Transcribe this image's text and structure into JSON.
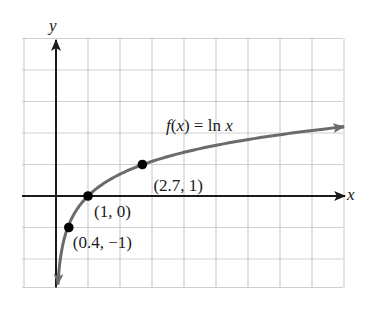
{
  "chart_data": {
    "type": "line",
    "title": "",
    "function_label": "f(x) = ln x",
    "function_label_parts": {
      "f": "f",
      "open": "(",
      "x": "x",
      "rest": ") = ln ",
      "x2": "x"
    },
    "xlabel": "x",
    "ylabel": "y",
    "xlim": [
      -1,
      9
    ],
    "ylim": [
      -3,
      5
    ],
    "grid": true,
    "grid_step": 1,
    "tick_labels_shown": false,
    "series": [
      {
        "name": "f(x) = ln x",
        "function": "ln",
        "x_range": [
          0.06,
          9.0
        ],
        "color": "#6b6b6b",
        "arrows": "both"
      }
    ],
    "points": [
      {
        "x": 0.4,
        "y": -1,
        "label": "(0.4, −1)"
      },
      {
        "x": 1,
        "y": 0,
        "label": "(1, 0)"
      },
      {
        "x": 2.7,
        "y": 1,
        "label": "(2.7, 1)"
      }
    ]
  },
  "colors": {
    "grid": "#cfcfcf",
    "axes": "#1a1a1a",
    "curve": "#6b6b6b",
    "points": "#000000",
    "text": "#1a1a1a"
  }
}
